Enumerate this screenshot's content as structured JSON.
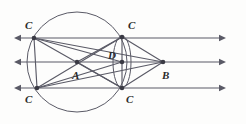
{
  "figure": {
    "type": "geometry-diagram",
    "background_color": "#fdfdfc",
    "stroke_color": "#5a5a66",
    "label_color": "#2b2b2b",
    "width": 246,
    "height": 124
  },
  "points": [
    {
      "id": "C_top_left",
      "label": "C",
      "x": 34,
      "y": 38,
      "label_x": 25,
      "label_y": 20,
      "marker": true
    },
    {
      "id": "C_top_right",
      "label": "C",
      "x": 122,
      "y": 37,
      "label_x": 128,
      "label_y": 20,
      "marker": true
    },
    {
      "id": "C_bottom_left",
      "label": "C",
      "x": 37,
      "y": 88,
      "label_x": 25,
      "label_y": 94,
      "marker": true
    },
    {
      "id": "C_bottom_right",
      "label": "C",
      "x": 122,
      "y": 88,
      "label_x": 126,
      "label_y": 94,
      "marker": true
    },
    {
      "id": "A",
      "label": "A",
      "x": 77,
      "y": 62,
      "label_x": 72,
      "label_y": 70,
      "marker": true
    },
    {
      "id": "D",
      "label": "D",
      "x": 122,
      "y": 62,
      "label_x": 108,
      "label_y": 50,
      "marker": true
    },
    {
      "id": "B",
      "label": "B",
      "x": 163,
      "y": 62,
      "label_x": 162,
      "label_y": 70,
      "marker": true
    }
  ],
  "circles": [
    {
      "id": "main-circle",
      "cx": 77,
      "cy": 62,
      "r": 50
    },
    {
      "id": "small-ellipse",
      "cx": 122,
      "cy": 62,
      "rx": 9,
      "ry": 26
    }
  ],
  "rays": [
    {
      "id": "ray-top",
      "y": 38,
      "left_tip_x": 14,
      "right_tip_x": 226,
      "double_arrow": true
    },
    {
      "id": "ray-middle",
      "y": 62,
      "left_tip_x": 14,
      "right_tip_x": 226,
      "double_arrow": true
    },
    {
      "id": "ray-bottom",
      "y": 88,
      "left_tip_x": 14,
      "right_tip_x": 226,
      "double_arrow": true
    }
  ],
  "segments": [
    {
      "id": "seg-Ctl-Cbl",
      "from": "C_top_left",
      "to": "C_bottom_left"
    },
    {
      "id": "seg-Ctl-B",
      "from": "C_top_left",
      "to": "B"
    },
    {
      "id": "seg-Ctl-Cbr",
      "from": "C_top_left",
      "to": "C_bottom_right"
    },
    {
      "id": "seg-Ctl-D",
      "from": "C_top_left",
      "to": "D"
    },
    {
      "id": "seg-Cbl-Ctr",
      "from": "C_bottom_left",
      "to": "C_top_right"
    },
    {
      "id": "seg-Cbl-B",
      "from": "C_bottom_left",
      "to": "B"
    },
    {
      "id": "seg-Cbl-D",
      "from": "C_bottom_left",
      "to": "D"
    },
    {
      "id": "seg-Ctr-Cbr",
      "from": "C_top_right",
      "to": "C_bottom_right"
    },
    {
      "id": "seg-Ctr-B",
      "from": "C_top_right",
      "to": "B"
    },
    {
      "id": "seg-Cbr-B",
      "from": "C_bottom_right",
      "to": "B"
    },
    {
      "id": "seg-Ctr-A",
      "from": "C_top_right",
      "to": "A"
    },
    {
      "id": "seg-Cbr-A",
      "from": "C_bottom_right",
      "to": "A"
    }
  ]
}
